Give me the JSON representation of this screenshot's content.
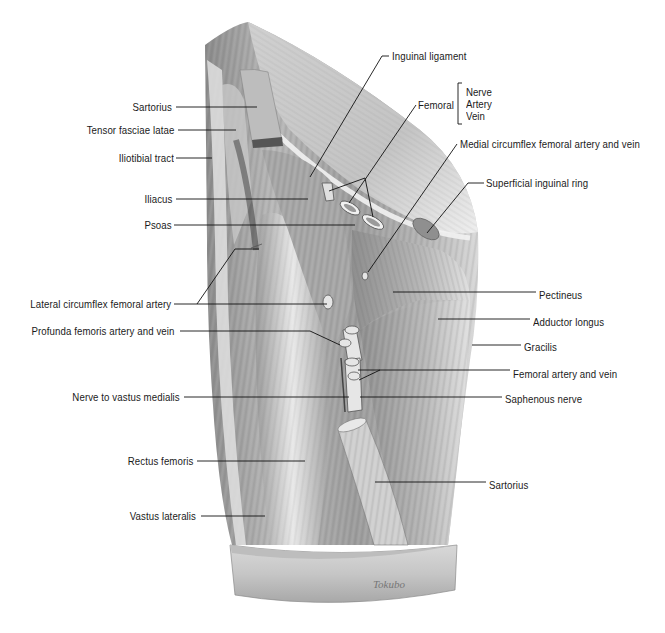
{
  "figure": {
    "signature": "Tokubo"
  },
  "labels_left": [
    {
      "id": "sartorius-upper",
      "text": "Sartorius",
      "x": 172,
      "y": 107
    },
    {
      "id": "tensor-fasciae-latae",
      "text": "Tensor fasciae latae",
      "x": 174,
      "y": 130
    },
    {
      "id": "iliotibial-tract",
      "text": "Iliotibial tract",
      "x": 174,
      "y": 158
    },
    {
      "id": "iliacus",
      "text": "Iliacus",
      "x": 172,
      "y": 199
    },
    {
      "id": "psoas",
      "text": "Psoas",
      "x": 172,
      "y": 225
    },
    {
      "id": "lateral-circumflex-femoral-artery",
      "text": "Lateral circumflex femoral artery",
      "x": 171,
      "y": 304
    },
    {
      "id": "profunda-femoris",
      "text": "Profunda femoris artery and vein",
      "x": 175,
      "y": 331
    },
    {
      "id": "nerve-to-vastus-medialis",
      "text": "Nerve to vastus medialis",
      "x": 180,
      "y": 397
    },
    {
      "id": "rectus-femoris",
      "text": "Rectus femoris",
      "x": 193,
      "y": 461
    },
    {
      "id": "vastus-lateralis",
      "text": "Vastus lateralis",
      "x": 196,
      "y": 516
    }
  ],
  "labels_right": [
    {
      "id": "inguinal-ligament",
      "text": "Inguinal ligament",
      "x": 392,
      "y": 56
    },
    {
      "id": "femoral",
      "text": "Femoral",
      "x": 418,
      "y": 105
    },
    {
      "id": "medial-circumflex",
      "text": "Medial circumflex femoral artery and vein",
      "x": 460,
      "y": 144
    },
    {
      "id": "superficial-inguinal-ring",
      "text": "Superficial inguinal ring",
      "x": 486,
      "y": 183
    },
    {
      "id": "pectineus",
      "text": "Pectineus",
      "x": 539,
      "y": 295
    },
    {
      "id": "adductor-longus",
      "text": "Adductor longus",
      "x": 533,
      "y": 322
    },
    {
      "id": "gracilis",
      "text": "Gracilis",
      "x": 524,
      "y": 347
    },
    {
      "id": "femoral-artery-and-vein",
      "text": "Femoral artery and vein",
      "x": 513,
      "y": 374
    },
    {
      "id": "saphenous-nerve",
      "text": "Saphenous nerve",
      "x": 505,
      "y": 399
    },
    {
      "id": "sartorius-lower",
      "text": "Sartorius",
      "x": 489,
      "y": 485
    }
  ],
  "femoral_bracket": {
    "items": [
      "Nerve",
      "Artery",
      "Vein"
    ]
  },
  "colors": {
    "text": "#1a1a1a",
    "leader": "#111111",
    "muscle_dark": "#6e6e6e",
    "muscle_mid": "#a3a3a3",
    "muscle_light": "#d4d4d4",
    "fascia": "#e6e6e6"
  }
}
